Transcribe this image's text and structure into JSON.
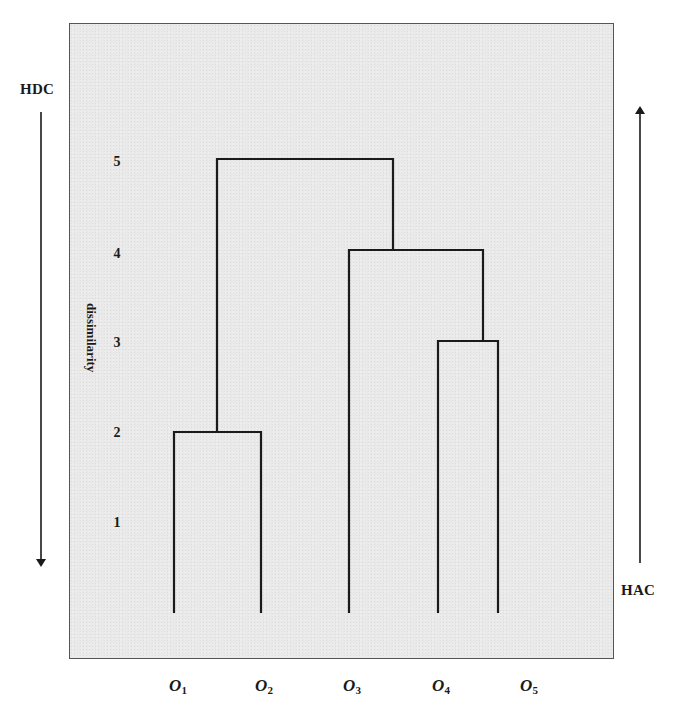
{
  "diagram": {
    "type": "dendrogram",
    "direction_labels": {
      "top_down": "HDC",
      "bottom_up": "HAC"
    },
    "axis": {
      "title": "dissimilarity",
      "ticks": [
        "5",
        "4",
        "3",
        "2",
        "1"
      ]
    },
    "leaves": [
      {
        "symbol": "O",
        "index": "1"
      },
      {
        "symbol": "O",
        "index": "2"
      },
      {
        "symbol": "O",
        "index": "3"
      },
      {
        "symbol": "O",
        "index": "4"
      },
      {
        "symbol": "O",
        "index": "5"
      }
    ],
    "merges": [
      {
        "clusters": [
          "O1",
          "O2"
        ],
        "height": 2
      },
      {
        "clusters": [
          "O4",
          "O5"
        ],
        "height": 3
      },
      {
        "clusters": [
          "O3",
          "{O4,O5}"
        ],
        "height": 4
      },
      {
        "clusters": [
          "{O1,O2}",
          "{O3,O4,O5}"
        ],
        "height": 5
      }
    ],
    "colors": {
      "line": "#1a1a1a",
      "panel": "#e9e9e9",
      "border": "#555555"
    }
  }
}
